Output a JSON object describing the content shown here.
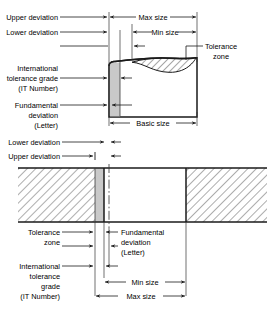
{
  "diagram": {
    "colors": {
      "line": "#1a1a1a",
      "thin_line": "#333333",
      "tolerance_band_fill": "#c9c9c9",
      "shaft_fill": "#ffffff",
      "hatch": "#555555",
      "background": "#ffffff"
    },
    "shaft": {
      "label_upper_deviation": "Upper deviation",
      "label_lower_deviation": "Lower deviation",
      "label_it_grade_line1": "International",
      "label_it_grade_line2": "tolerance grade",
      "label_it_grade_line3": "(IT Number)",
      "label_fundamental_line1": "Fundamental",
      "label_fundamental_line2": "deviation",
      "label_fundamental_line3": "(Letter)",
      "dim_max_size": "Max size",
      "dim_min_size": "Min size",
      "dim_basic_size": "Basic size",
      "label_tolerance_zone_line1": "Tolerance",
      "label_tolerance_zone_line2": "zone"
    },
    "hole": {
      "label_lower_deviation": "Lower deviation",
      "label_upper_deviation": "Upper deviation",
      "label_tolerance_zone_line1": "Tolerance",
      "label_tolerance_zone_line2": "zone",
      "label_fundamental_line1": "Fundamental",
      "label_fundamental_line2": "deviation",
      "label_fundamental_line3": "(Letter)",
      "label_it_grade_line1": "International",
      "label_it_grade_line2": "tolerance",
      "label_it_grade_line3": "grade",
      "label_it_grade_line4": "(IT Number)",
      "dim_min_size": "Min size",
      "dim_max_size": "Max size"
    }
  }
}
